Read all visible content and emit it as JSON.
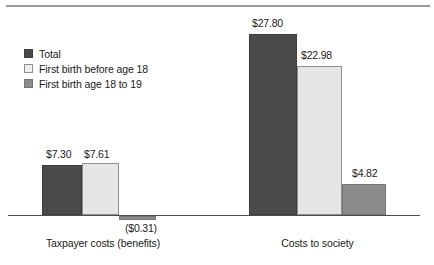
{
  "chart_data": {
    "type": "bar",
    "title": "",
    "xlabel": "",
    "ylabel": "",
    "categories": [
      "Taxpayer costs (benefits)",
      "Costs to society"
    ],
    "series": [
      {
        "name": "Total",
        "color": "#4a4a4a",
        "values": [
          7.3,
          27.8
        ],
        "labels": [
          "$7.30",
          "$27.80"
        ]
      },
      {
        "name": "First birth before age 18",
        "color": "#e6e6e6",
        "values": [
          7.61,
          22.98
        ],
        "labels": [
          "$7.61",
          "$22.98"
        ]
      },
      {
        "name": "First birth age 18 to 19",
        "color": "#8c8c8c",
        "values": [
          -0.31,
          4.82
        ],
        "labels": [
          "($0.31)",
          "$4.82"
        ]
      }
    ],
    "ylim": [
      -2,
      30
    ],
    "grid": false,
    "legend_position": "top-left",
    "axis_line": true
  },
  "legend": {
    "items": [
      {
        "label": "Total",
        "swatch": "series-total"
      },
      {
        "label": "First birth before age 18",
        "swatch": "series-before18"
      },
      {
        "label": "First birth age 18 to 19",
        "swatch": "series-18to19"
      }
    ]
  },
  "axis": {
    "categories": [
      {
        "label": "Taxpayer costs (benefits)"
      },
      {
        "label": "Costs to society"
      }
    ]
  },
  "bars": [
    {
      "name": "bar-taxpayer-total",
      "label": "$7.30",
      "series": "series-total",
      "left": 42,
      "top": 165,
      "width": 40,
      "height": 50
    },
    {
      "name": "bar-taxpayer-before18",
      "label": "$7.61",
      "series": "series-before18",
      "left": 82,
      "top": 163,
      "width": 37,
      "height": 52
    },
    {
      "name": "bar-taxpayer-18to19",
      "label": "($0.31)",
      "series": "series-18to19",
      "left": 119,
      "top": 216,
      "width": 37,
      "height": 4
    },
    {
      "name": "bar-society-total",
      "label": "$27.80",
      "series": "series-total",
      "left": 249,
      "top": 34,
      "width": 48,
      "height": 181
    },
    {
      "name": "bar-society-before18",
      "label": "$22.98",
      "series": "series-before18",
      "left": 297,
      "top": 66,
      "width": 45,
      "height": 149
    },
    {
      "name": "bar-society-18to19",
      "label": "$4.82",
      "series": "series-18to19",
      "left": 342,
      "top": 184,
      "width": 44,
      "height": 31
    }
  ],
  "value_labels": [
    {
      "name": "value-label-taxpayer-total",
      "text": "$7.30",
      "left": 46,
      "top": 148
    },
    {
      "name": "value-label-taxpayer-before18",
      "text": "$7.61",
      "left": 84,
      "top": 148
    },
    {
      "name": "value-label-taxpayer-18to19",
      "text": "($0.31)",
      "left": 125,
      "top": 222
    },
    {
      "name": "value-label-society-total",
      "text": "$27.80",
      "left": 252,
      "top": 17
    },
    {
      "name": "value-label-society-before18",
      "text": "$22.98",
      "left": 301,
      "top": 49
    },
    {
      "name": "value-label-society-18to19",
      "text": "$4.82",
      "left": 352,
      "top": 167
    }
  ],
  "category_labels": [
    {
      "name": "category-label-taxpayer",
      "text": "Taxpayer costs (benefits)",
      "left": 28,
      "top": 237,
      "width": 150
    },
    {
      "name": "category-label-society",
      "text": "Costs to society",
      "left": 245,
      "top": 237,
      "width": 145
    }
  ]
}
